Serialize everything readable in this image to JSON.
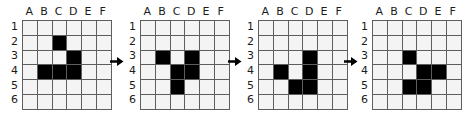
{
  "figure": {
    "grid_count": 4,
    "arrow_count": 3,
    "arrow_glyph": "right-arrow",
    "colors": {
      "filled_cell": "#000000",
      "empty_cell": "#f4f4f4",
      "grid_line": "#5e5e5e",
      "label_text": "#1b1b1b",
      "background": "#ffffff"
    }
  },
  "columns": [
    "A",
    "B",
    "C",
    "D",
    "E",
    "F"
  ],
  "rows": [
    "1",
    "2",
    "3",
    "4",
    "5",
    "6"
  ],
  "grids": [
    {
      "name": "grid-1",
      "cells": [
        [
          0,
          0,
          0,
          0,
          0,
          0
        ],
        [
          0,
          0,
          1,
          0,
          0,
          0
        ],
        [
          0,
          0,
          0,
          1,
          0,
          0
        ],
        [
          0,
          1,
          1,
          1,
          0,
          0
        ],
        [
          0,
          0,
          0,
          0,
          0,
          0
        ],
        [
          0,
          0,
          0,
          0,
          0,
          0
        ]
      ],
      "filled_labels": [
        "C2",
        "D3",
        "B4",
        "C4",
        "D4"
      ]
    },
    {
      "name": "grid-2",
      "cells": [
        [
          0,
          0,
          0,
          0,
          0,
          0
        ],
        [
          0,
          0,
          0,
          0,
          0,
          0
        ],
        [
          0,
          1,
          0,
          1,
          0,
          0
        ],
        [
          0,
          0,
          1,
          1,
          0,
          0
        ],
        [
          0,
          0,
          1,
          0,
          0,
          0
        ],
        [
          0,
          0,
          0,
          0,
          0,
          0
        ]
      ],
      "filled_labels": [
        "B3",
        "D3",
        "C4",
        "D4",
        "C5"
      ]
    },
    {
      "name": "grid-3",
      "cells": [
        [
          0,
          0,
          0,
          0,
          0,
          0
        ],
        [
          0,
          0,
          0,
          0,
          0,
          0
        ],
        [
          0,
          0,
          0,
          1,
          0,
          0
        ],
        [
          0,
          1,
          0,
          1,
          0,
          0
        ],
        [
          0,
          0,
          1,
          1,
          0,
          0
        ],
        [
          0,
          0,
          0,
          0,
          0,
          0
        ]
      ],
      "filled_labels": [
        "D3",
        "B4",
        "D4",
        "C5",
        "D5"
      ]
    },
    {
      "name": "grid-4",
      "cells": [
        [
          0,
          0,
          0,
          0,
          0,
          0
        ],
        [
          0,
          0,
          0,
          0,
          0,
          0
        ],
        [
          0,
          0,
          1,
          0,
          0,
          0
        ],
        [
          0,
          0,
          0,
          1,
          1,
          0
        ],
        [
          0,
          0,
          1,
          1,
          0,
          0
        ],
        [
          0,
          0,
          0,
          0,
          0,
          0
        ]
      ],
      "filled_labels": [
        "C3",
        "D4",
        "E4",
        "C5",
        "D5"
      ]
    }
  ]
}
